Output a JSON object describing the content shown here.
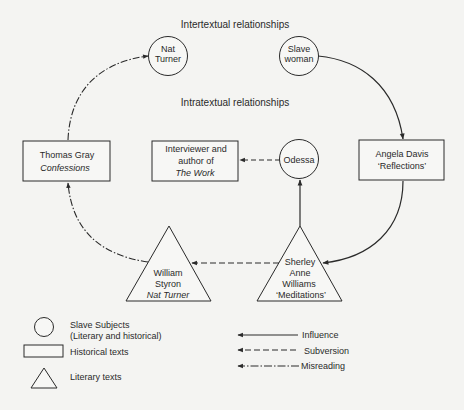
{
  "headings": {
    "intertextual": "Intertextual relationships",
    "intratextual": "Intratextual relationships"
  },
  "nodes": {
    "nat_turner": {
      "shape": "circle",
      "lines": [
        "Nat",
        "Turner"
      ]
    },
    "slave_woman": {
      "shape": "circle",
      "lines": [
        "Slave",
        "woman"
      ]
    },
    "odessa": {
      "shape": "circle",
      "lines": [
        "Odessa"
      ]
    },
    "thomas_gray": {
      "shape": "rectangle",
      "lines": [
        "Thomas Gray"
      ],
      "italic": "Confessions"
    },
    "interviewer": {
      "shape": "rectangle",
      "lines": [
        "Interviewer and",
        "author of"
      ],
      "italic": "The Work"
    },
    "angela_davis": {
      "shape": "rectangle",
      "lines": [
        "Angela Davis",
        "‘Reflections’"
      ]
    },
    "styron": {
      "shape": "triangle",
      "lines": [
        "William",
        "Styron"
      ],
      "italic": "Nat Turner"
    },
    "sherley": {
      "shape": "triangle",
      "lines": [
        "Sherley",
        "Anne",
        "Williams",
        "‘Meditations’"
      ]
    }
  },
  "edges": [
    {
      "from": "slave_woman",
      "to": "angela_davis",
      "type": "influence"
    },
    {
      "from": "angela_davis",
      "to": "sherley",
      "type": "influence"
    },
    {
      "from": "sherley",
      "to": "odessa",
      "type": "influence"
    },
    {
      "from": "odessa",
      "to": "interviewer",
      "type": "subversion"
    },
    {
      "from": "sherley",
      "to": "styron",
      "type": "subversion"
    },
    {
      "from": "styron",
      "to": "thomas_gray",
      "type": "misreading"
    },
    {
      "from": "thomas_gray",
      "to": "nat_turner",
      "type": "misreading"
    }
  ],
  "legend": {
    "shapes": [
      {
        "shape": "circle",
        "lines": [
          "Slave Subjects",
          "(Literary and historical)"
        ]
      },
      {
        "shape": "rectangle",
        "lines": [
          "Historical texts"
        ]
      },
      {
        "shape": "triangle",
        "lines": [
          "Literary texts"
        ]
      }
    ],
    "lines": [
      {
        "style": "solid",
        "label": "Influence"
      },
      {
        "style": "dashed",
        "label": "Subversion"
      },
      {
        "style": "dash-dot",
        "label": "Misreading"
      }
    ]
  },
  "colors": {
    "background": "#f4f4f2",
    "ink": "#2a2a2a",
    "shape_fill": "#f7f7f5"
  }
}
